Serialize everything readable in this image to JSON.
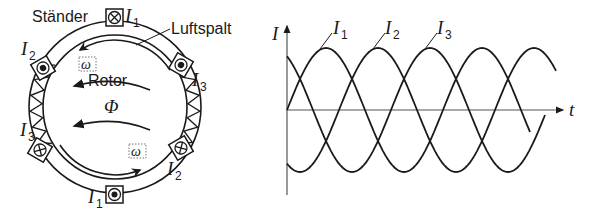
{
  "motor_diagram": {
    "labels": {
      "stator": "Ständer",
      "air_gap": "Luftspalt",
      "rotor": "Rotor",
      "flux": "Φ",
      "omega": "ω"
    },
    "conductors": [
      {
        "phase": "I",
        "sub": "1",
        "position": "top",
        "direction": "into-page"
      },
      {
        "phase": "I",
        "sub": "1",
        "position": "bottom",
        "direction": "out-of-page"
      },
      {
        "phase": "I",
        "sub": "2",
        "position": "upper-left",
        "direction": "out-of-page"
      },
      {
        "phase": "I",
        "sub": "2",
        "position": "lower-right",
        "direction": "into-page"
      },
      {
        "phase": "I",
        "sub": "3",
        "position": "upper-right",
        "direction": "out-of-page"
      },
      {
        "phase": "I",
        "sub": "3",
        "position": "lower-left",
        "direction": "into-page"
      }
    ]
  },
  "chart_data": {
    "type": "line",
    "title": "",
    "xlabel": "t",
    "ylabel": "I",
    "series": [
      {
        "name": "I1",
        "label": "I",
        "sub": "1",
        "phase_deg": 0
      },
      {
        "name": "I2",
        "label": "I",
        "sub": "2",
        "phase_deg": -120
      },
      {
        "name": "I3",
        "label": "I",
        "sub": "3",
        "phase_deg": 120
      }
    ],
    "function": "sinusoidal, equal amplitude, 120° phase shift",
    "periods_shown": 1.7,
    "grid": false,
    "legend": "inline labels with leader lines"
  }
}
